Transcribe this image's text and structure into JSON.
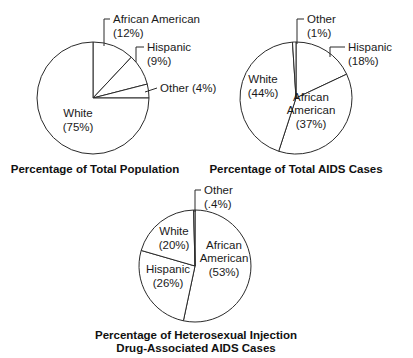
{
  "chart_data": [
    {
      "type": "pie",
      "title": "Percentage of Total Population",
      "start": "12 o'clock, clockwise",
      "slices": [
        {
          "name": "African American",
          "value": 12,
          "label_lines": [
            "African American",
            "(12%)"
          ],
          "label_style": "leader"
        },
        {
          "name": "Hispanic",
          "value": 9,
          "label_lines": [
            "Hispanic",
            "(9%)"
          ],
          "label_style": "leader"
        },
        {
          "name": "Other",
          "value": 4,
          "label_lines": [
            "Other (4%)"
          ],
          "label_style": "leader"
        },
        {
          "name": "White",
          "value": 75,
          "label_lines": [
            "White",
            "(75%)"
          ],
          "label_style": "inside"
        }
      ]
    },
    {
      "type": "pie",
      "title": "Percentage of Total AIDS Cases",
      "start": "12 o'clock, clockwise",
      "slices": [
        {
          "name": "Hispanic",
          "value": 18,
          "label_lines": [
            "Hispanic",
            "(18%)"
          ],
          "label_style": "leader"
        },
        {
          "name": "African American",
          "value": 37,
          "label_lines": [
            "African",
            "American",
            "(37%)"
          ],
          "label_style": "inside"
        },
        {
          "name": "White",
          "value": 44,
          "label_lines": [
            "White",
            "(44%)"
          ],
          "label_style": "inside"
        },
        {
          "name": "Other",
          "value": 1,
          "label_lines": [
            "Other",
            "(1%)"
          ],
          "label_style": "leader"
        }
      ]
    },
    {
      "type": "pie",
      "title": "Percentage of Heterosexual Injection Drug-Associated AIDS Cases",
      "title_lines": [
        "Percentage of Heterosexual Injection",
        "Drug-Associated AIDS Cases"
      ],
      "start": "12 o'clock, clockwise",
      "slices": [
        {
          "name": "African American",
          "value": 53,
          "label_lines": [
            "African",
            "American",
            "(53%)"
          ],
          "label_style": "inside"
        },
        {
          "name": "Hispanic",
          "value": 26,
          "label_lines": [
            "Hispanic",
            "(26%)"
          ],
          "label_style": "inside"
        },
        {
          "name": "White",
          "value": 20,
          "label_lines": [
            "White",
            "(20%)"
          ],
          "label_style": "inside"
        },
        {
          "name": "Other",
          "value": 0.4,
          "label_lines": [
            "Other",
            "(.4%)"
          ],
          "label_style": "leader"
        }
      ]
    }
  ]
}
